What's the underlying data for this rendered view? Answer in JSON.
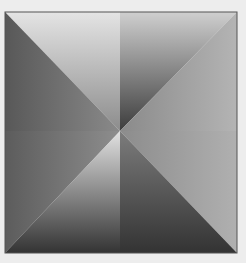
{
  "figure": {
    "background": "#ededed",
    "frame_color": "#555555",
    "frame": {
      "x": 5,
      "y": 12,
      "width": 232,
      "height": 241
    },
    "center": {
      "x": 120,
      "y": 131
    },
    "regions": [
      {
        "name": "top-left-wedge",
        "from": "#e4e4e4",
        "to": "#8c8c8c"
      },
      {
        "name": "top-right-wedge",
        "from": "#cfcfcf",
        "to": "#3c3c3c"
      },
      {
        "name": "left-upper",
        "from": "#585858",
        "to": "#8a8a8a"
      },
      {
        "name": "left-lower",
        "from": "#5c5c5c",
        "to": "#8e8e8e"
      },
      {
        "name": "right-upper",
        "from": "#b4b4b4",
        "to": "#8a8a8a"
      },
      {
        "name": "right-lower",
        "from": "#b0b0b0",
        "to": "#8c8c8c"
      },
      {
        "name": "bottom-left-wedge",
        "from": "#e2e2e2",
        "to": "#333333"
      },
      {
        "name": "bottom-right-wedge",
        "from": "#7c7c7c",
        "to": "#333333"
      }
    ]
  }
}
